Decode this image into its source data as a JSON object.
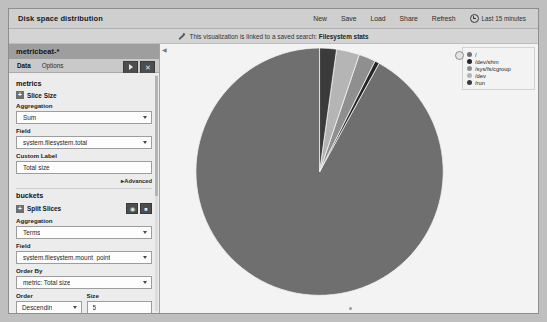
{
  "window": {
    "title": "Disk space distribution",
    "nav_items": [
      {
        "label": "New",
        "name": "new"
      },
      {
        "label": "Save",
        "name": "save"
      },
      {
        "label": "Load",
        "name": "load"
      },
      {
        "label": "Share",
        "name": "share"
      },
      {
        "label": "Refresh",
        "name": "refresh"
      }
    ],
    "time_range": "Last 15 minutes"
  },
  "linked_search": {
    "prefix": "This visualization is linked to a saved search: ",
    "name": "Filesystem stats"
  },
  "sidebar": {
    "index_pattern": "metricbeat-*",
    "tabs": [
      {
        "label": "Data",
        "active": true
      },
      {
        "label": "Options",
        "active": false
      }
    ],
    "apply_label": "▶",
    "close_label": "✕",
    "metrics": {
      "section_label": "metrics",
      "agg_row_label": "Slice Size",
      "expander": "+",
      "aggregation_label": "Aggregation",
      "aggregation_value": "Sum",
      "field_label": "Field",
      "field_value": "system.filesystem.total",
      "custom_label_label": "Custom Label",
      "custom_label_value": "Total size"
    },
    "advanced_link": "Advanced",
    "buckets": {
      "section_label": "buckets",
      "agg_row_label": "Split Slices",
      "expander": "+",
      "aggregation_label": "Aggregation",
      "aggregation_value": "Terms",
      "field_label": "Field",
      "field_value": "system.filesystem.mount_point",
      "order_by_label": "Order By",
      "order_by_value": "metric: Total size",
      "order_label": "Order",
      "order_value": "Descendin",
      "size_label": "Size",
      "size_value": "5"
    }
  },
  "chart_data": {
    "type": "pie",
    "title": "Disk space distribution",
    "categories": [
      "/",
      "/dev/shm",
      "/sys/fs/cgroup",
      "/dev",
      "/run"
    ],
    "values": [
      92.0,
      0.6,
      2.2,
      3.0,
      2.2
    ],
    "colors": [
      "#6f6f6f",
      "#262626",
      "#8f8f8f",
      "#b5b5b5",
      "#3b3b3b"
    ],
    "legend_position": "right",
    "start_angle": -90,
    "direction": "counterclockwise",
    "center": {
      "x": 310,
      "y": 175
    },
    "radius": 124,
    "legend": [
      {
        "label": "/",
        "color": "#6f6f6f"
      },
      {
        "label": "/dev/shm",
        "color": "#262626"
      },
      {
        "label": "/sys/fs/cgroup",
        "color": "#8f8f8f"
      },
      {
        "label": "/dev",
        "color": "#b5b5b5"
      },
      {
        "label": "/run",
        "color": "#3b3b3b"
      }
    ]
  }
}
